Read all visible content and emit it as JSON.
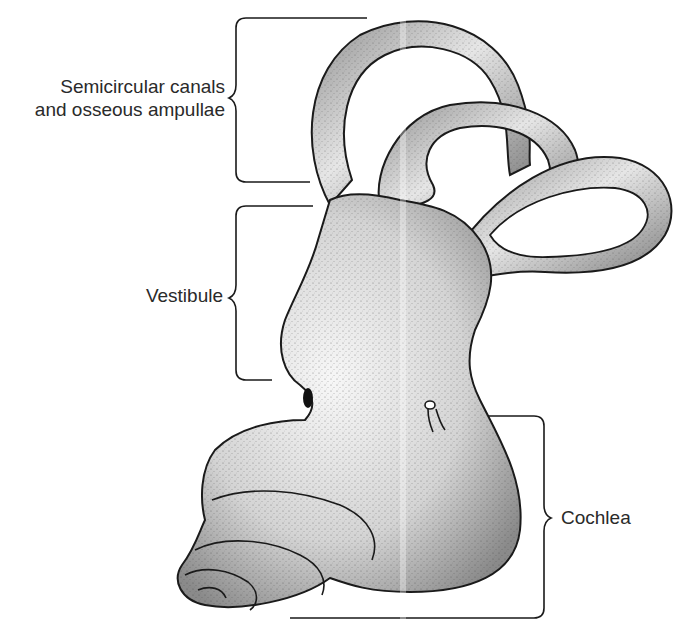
{
  "figure": {
    "labels": [
      {
        "id": "semicircular-canals",
        "lines": [
          "Semicircular canals",
          "and osseous ampullae"
        ]
      },
      {
        "id": "vestibule",
        "lines": [
          "Vestibule"
        ]
      },
      {
        "id": "cochlea",
        "lines": [
          "Cochlea"
        ]
      }
    ],
    "colors": {
      "ink": "#1a1a1a",
      "label_text": "#2a2a2a",
      "shade": "#9a9a9a",
      "light": "#f2f2f2",
      "background": "#ffffff"
    }
  }
}
